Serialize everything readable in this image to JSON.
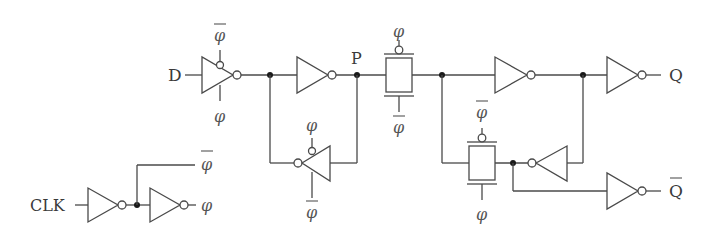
{
  "diagram": {
    "colors": {
      "wire": "#4a4a4a",
      "node_dot": "#1a1a1a",
      "text": "#3a3a3a",
      "background": "#ffffff"
    },
    "labels": {
      "input_d": "D",
      "node_p": "P",
      "output_q": "Q",
      "output_qbar": "Q",
      "clock_in": "CLK",
      "phi": "φ",
      "phi_bar": "φ"
    },
    "components": [
      {
        "id": "clocked-inverter-input",
        "type": "clocked-inverter",
        "top_control": "φ̄",
        "bottom_control": "φ"
      },
      {
        "id": "inverter-master",
        "type": "inverter"
      },
      {
        "id": "clocked-inverter-master-feedback",
        "type": "clocked-inverter",
        "direction": "left",
        "top_control": "φ",
        "bottom_control": "φ̄"
      },
      {
        "id": "transmission-gate-1",
        "type": "transmission-gate",
        "top_control": "φ",
        "bottom_control": "φ̄"
      },
      {
        "id": "inverter-slave",
        "type": "inverter"
      },
      {
        "id": "transmission-gate-2",
        "type": "transmission-gate",
        "top_control": "φ̄",
        "bottom_control": "φ"
      },
      {
        "id": "inverter-slave-feedback",
        "type": "inverter",
        "direction": "left"
      },
      {
        "id": "inverter-output-q",
        "type": "inverter"
      },
      {
        "id": "inverter-output-qbar",
        "type": "inverter"
      },
      {
        "id": "clock-inverter-1",
        "type": "inverter",
        "output": "φ̄"
      },
      {
        "id": "clock-inverter-2",
        "type": "inverter",
        "output": "φ"
      }
    ]
  }
}
